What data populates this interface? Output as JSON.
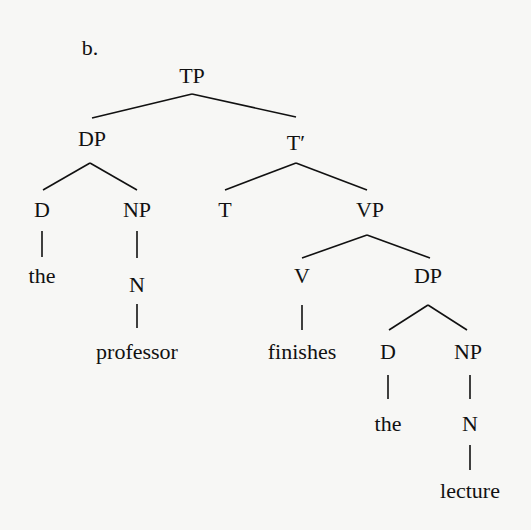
{
  "figure": {
    "label": "b.",
    "line_color": "#111111",
    "background": "#f7f7f5"
  },
  "nodes": [
    {
      "id": "tp",
      "text": "TP",
      "x": 192,
      "y": 76
    },
    {
      "id": "dp1",
      "text": "DP",
      "x": 92,
      "y": 139
    },
    {
      "id": "tbar",
      "text": "T′",
      "x": 296,
      "y": 143
    },
    {
      "id": "d1",
      "text": "D",
      "x": 42,
      "y": 210
    },
    {
      "id": "np1",
      "text": "NP",
      "x": 137,
      "y": 210
    },
    {
      "id": "t",
      "text": "T",
      "x": 225,
      "y": 210
    },
    {
      "id": "vp",
      "text": "VP",
      "x": 370,
      "y": 210
    },
    {
      "id": "the1",
      "text": "the",
      "x": 42,
      "y": 276
    },
    {
      "id": "n1",
      "text": "N",
      "x": 137,
      "y": 285
    },
    {
      "id": "v",
      "text": "V",
      "x": 302,
      "y": 276
    },
    {
      "id": "dp2",
      "text": "DP",
      "x": 428,
      "y": 276
    },
    {
      "id": "professor",
      "text": "professor",
      "x": 137,
      "y": 352
    },
    {
      "id": "finishes",
      "text": "finishes",
      "x": 302,
      "y": 352
    },
    {
      "id": "d2",
      "text": "D",
      "x": 388,
      "y": 352
    },
    {
      "id": "np2",
      "text": "NP",
      "x": 468,
      "y": 352
    },
    {
      "id": "the2",
      "text": "the",
      "x": 388,
      "y": 424
    },
    {
      "id": "n2",
      "text": "N",
      "x": 470,
      "y": 424
    },
    {
      "id": "lecture",
      "text": "lecture",
      "x": 470,
      "y": 491
    }
  ],
  "edges": [
    {
      "from": "TP",
      "to": "DP",
      "x1": 192,
      "y1": 94,
      "x2": 92,
      "y2": 118
    },
    {
      "from": "TP",
      "to": "T′",
      "x1": 192,
      "y1": 94,
      "x2": 296,
      "y2": 117
    },
    {
      "from": "DP",
      "to": "D",
      "x1": 90,
      "y1": 163,
      "x2": 43,
      "y2": 190
    },
    {
      "from": "DP",
      "to": "NP",
      "x1": 90,
      "y1": 163,
      "x2": 137,
      "y2": 190
    },
    {
      "from": "T′",
      "to": "T",
      "x1": 296,
      "y1": 163,
      "x2": 225,
      "y2": 190
    },
    {
      "from": "T′",
      "to": "VP",
      "x1": 296,
      "y1": 163,
      "x2": 367,
      "y2": 190
    },
    {
      "from": "D",
      "to": "the",
      "x1": 42,
      "y1": 231,
      "x2": 42,
      "y2": 257
    },
    {
      "from": "NP",
      "to": "N",
      "x1": 137,
      "y1": 231,
      "x2": 137,
      "y2": 258
    },
    {
      "from": "VP",
      "to": "V",
      "x1": 367,
      "y1": 235,
      "x2": 302,
      "y2": 258
    },
    {
      "from": "VP",
      "to": "DP",
      "x1": 367,
      "y1": 235,
      "x2": 430,
      "y2": 258
    },
    {
      "from": "N",
      "to": "professor",
      "x1": 137,
      "y1": 304,
      "x2": 137,
      "y2": 328
    },
    {
      "from": "V",
      "to": "finishes",
      "x1": 302,
      "y1": 305,
      "x2": 302,
      "y2": 330
    },
    {
      "from": "DP",
      "to": "D",
      "x1": 428,
      "y1": 305,
      "x2": 389,
      "y2": 330
    },
    {
      "from": "DP",
      "to": "NP",
      "x1": 428,
      "y1": 305,
      "x2": 467,
      "y2": 330
    },
    {
      "from": "D",
      "to": "the",
      "x1": 388,
      "y1": 375,
      "x2": 388,
      "y2": 399
    },
    {
      "from": "NP",
      "to": "N",
      "x1": 470,
      "y1": 375,
      "x2": 470,
      "y2": 399
    },
    {
      "from": "N",
      "to": "lecture",
      "x1": 470,
      "y1": 445,
      "x2": 470,
      "y2": 470
    }
  ]
}
